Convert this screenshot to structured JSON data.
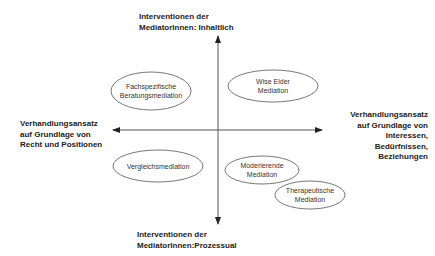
{
  "axes": {
    "top": {
      "lines": [
        "Interventionen der",
        "MediatorInnen: Inhaltlich"
      ]
    },
    "bottom": {
      "lines": [
        "Interventionen der",
        "MediatorInnen:Prozessual"
      ]
    },
    "left": {
      "lines": [
        "Verhandlungsansatz",
        "auf Grundlage von",
        "Recht und Positionen"
      ]
    },
    "right": {
      "lines": [
        "Verhandlungsansatz",
        "auf Grundlage von",
        "Interessen,",
        "Bedürfnissen,",
        "Beziehungen"
      ]
    }
  },
  "ellipses": [
    {
      "id": "fachspezifische",
      "lines": [
        "Fachspezifische",
        "Beratungsmediation"
      ],
      "cx": 151,
      "cy": 91,
      "rx": 40,
      "ry": 19
    },
    {
      "id": "wise-elder",
      "lines": [
        "Wise Elder",
        "Mediation"
      ],
      "cx": 273,
      "cy": 86,
      "rx": 45,
      "ry": 16
    },
    {
      "id": "vergleichs",
      "lines": [
        "Vergleichsmediation"
      ],
      "cx": 158,
      "cy": 166,
      "rx": 45,
      "ry": 16
    },
    {
      "id": "moderierende",
      "lines": [
        "Moderierende",
        "Mediation"
      ],
      "cx": 262,
      "cy": 170,
      "rx": 37,
      "ry": 14
    },
    {
      "id": "therapeutische",
      "lines": [
        "Therapeutische",
        "Mediation"
      ],
      "cx": 310,
      "cy": 195,
      "rx": 35,
      "ry": 14
    }
  ],
  "colors": {
    "line": "#333333",
    "text": "#222222",
    "background": "#ffffff"
  }
}
